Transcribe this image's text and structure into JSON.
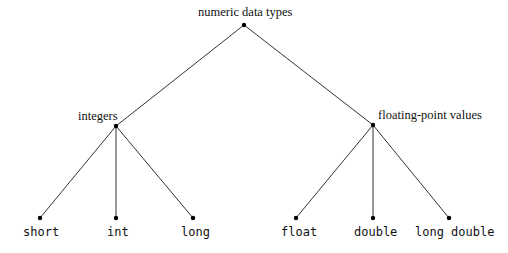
{
  "tree": {
    "root": {
      "label": "numeric data types",
      "x": 244,
      "y": 25
    },
    "categories": [
      {
        "label": "integers",
        "x": 116,
        "y": 126,
        "children": [
          {
            "label": "short",
            "x": 40,
            "y": 218
          },
          {
            "label": "int",
            "x": 116,
            "y": 218
          },
          {
            "label": "long",
            "x": 193,
            "y": 218
          }
        ]
      },
      {
        "label": "floating-point values",
        "x": 373,
        "y": 125,
        "children": [
          {
            "label": "float",
            "x": 296,
            "y": 218
          },
          {
            "label": "double",
            "x": 373,
            "y": 218
          },
          {
            "label": "long double",
            "x": 449,
            "y": 218
          }
        ]
      }
    ]
  },
  "colors": {
    "line": "#333333",
    "node": "#000000"
  }
}
